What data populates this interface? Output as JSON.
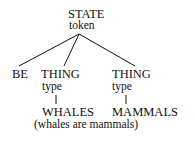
{
  "root": {
    "label": "STATE",
    "sub": "token"
  },
  "children": [
    {
      "label": "BE"
    },
    {
      "label": "THING",
      "sub": "type",
      "leaf": "WHALES"
    },
    {
      "label": "THING",
      "sub": "type",
      "leaf": "MAMMALS"
    }
  ],
  "caption": "(whales are mammals)"
}
